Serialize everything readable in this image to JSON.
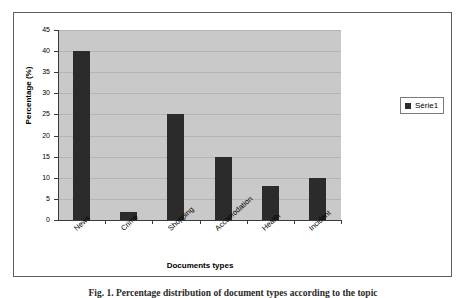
{
  "figure": {
    "caption": "Fig. 1. Percentage distribution of document types according to the topic"
  },
  "legend": {
    "position": "right",
    "swatch_color": "#2b2b2b",
    "entries": [
      {
        "label": "Série1"
      }
    ]
  },
  "axes": {
    "y_title": "Percentage (%)",
    "x_title": "Documents types"
  },
  "colors": {
    "bar": "#2b2b2b",
    "plot_background": "#c9c9c9",
    "gridline": "#b4b4b4",
    "frame": "#5b5f63",
    "axis": "#3a3a3a"
  },
  "chart_data": {
    "type": "bar",
    "title": "",
    "subtitle": "",
    "xlabel": "Documents types",
    "ylabel": "Percentage (%)",
    "categories": [
      "News",
      "Crime",
      "Shopping",
      "Accomodation",
      "Health",
      "Incident"
    ],
    "values": [
      40,
      2,
      25,
      15,
      8,
      10
    ],
    "series": [
      {
        "name": "Série1",
        "values": [
          40,
          2,
          25,
          15,
          8,
          10
        ]
      }
    ],
    "ylim": [
      0,
      45
    ],
    "ytick_labels": [
      "0",
      "5",
      "10",
      "15",
      "20",
      "25",
      "30",
      "35",
      "40",
      "45"
    ],
    "ytick_values": [
      0,
      5,
      10,
      15,
      20,
      25,
      30,
      35,
      40,
      45
    ],
    "grid": true,
    "grid_axis": "y",
    "legend_position": "right",
    "xtick_label_rotation": -42
  }
}
